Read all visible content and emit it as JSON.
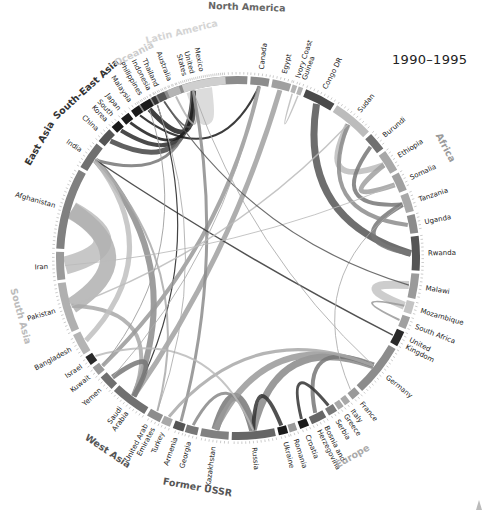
{
  "title": "1990–1995",
  "chart_data": {
    "type": "chord",
    "title": "1990–1995",
    "center": [
      238,
      258
    ],
    "outer_radius": 182,
    "regions": [
      {
        "name": "North America",
        "color": "#555555",
        "countries": [
          "United States",
          "Canada"
        ]
      },
      {
        "name": "Africa",
        "color": "#9a9a9a",
        "countries": [
          "Egypt",
          "Ivory Coast",
          "Guinea",
          "Congo DR",
          "Sudan",
          "Burundi",
          "Ethiopia",
          "Somalia",
          "Tanzania",
          "Uganda",
          "Rwanda",
          "Malawi",
          "Mozambique",
          "South Africa"
        ]
      },
      {
        "name": "Europe",
        "color": "#aaaaaa",
        "countries": [
          "United Kingdom",
          "Germany",
          "France",
          "Italy",
          "Greece",
          "Serbia",
          "Bosnia and Herzegovina",
          "Croatia",
          "Romania",
          "Ukraine"
        ]
      },
      {
        "name": "Former USSR",
        "color": "#555555",
        "countries": [
          "Russia",
          "Kazakhstan",
          "Georgia",
          "Armenia"
        ]
      },
      {
        "name": "West Asia",
        "color": "#555555",
        "countries": [
          "Turkey",
          "United Arab Emirates",
          "Saudi Arabia",
          "Yemen",
          "Kuwait",
          "Israel"
        ]
      },
      {
        "name": "South Asia",
        "color": "#bbbbbb",
        "countries": [
          "Bangladesh",
          "Pakistan",
          "Iran",
          "Afghanistan",
          "India"
        ]
      },
      {
        "name": "East Asia",
        "color": "#333333",
        "countries": [
          "China",
          "South Korea",
          "Japan"
        ]
      },
      {
        "name": "South-East Asia",
        "color": "#333333",
        "countries": [
          "Malaysia",
          "Philippines",
          "Indonesia",
          "Thailand"
        ]
      },
      {
        "name": "Oceania",
        "color": "#cccccc",
        "countries": [
          "Australia"
        ]
      },
      {
        "name": "Latin America",
        "color": "#d4d4d4",
        "countries": [
          "Mexico"
        ]
      }
    ],
    "segments": [
      {
        "label": "United States",
        "lines": [
          "United",
          "States"
        ],
        "start": -33,
        "end": 3,
        "fill": "#8c8c8c"
      },
      {
        "label": "Canada",
        "lines": [
          "Canada"
        ],
        "start": 4,
        "end": 10,
        "fill": "#8c8c8c"
      },
      {
        "label": "Egypt",
        "lines": [
          "Egypt"
        ],
        "start": 11,
        "end": 17,
        "fill": "#a0a0a0"
      },
      {
        "label": "Ivory Coast",
        "lines": [
          "Ivory Coast"
        ],
        "start": 17.5,
        "end": 19,
        "fill": "#b4b4b4"
      },
      {
        "label": "Guinea",
        "lines": [
          "Guinea"
        ],
        "start": 19.5,
        "end": 21,
        "fill": "#b4b4b4"
      },
      {
        "label": "Congo DR",
        "lines": [
          "Congo DR"
        ],
        "start": 22,
        "end": 32,
        "fill": "#4a4a4a"
      },
      {
        "label": "Sudan",
        "lines": [
          "Sudan"
        ],
        "start": 33,
        "end": 46,
        "fill": "#bcbcbc"
      },
      {
        "label": "Burundi",
        "lines": [
          "Burundi"
        ],
        "start": 47,
        "end": 53,
        "fill": "#707070"
      },
      {
        "label": "Ethiopia",
        "lines": [
          "Ethiopia"
        ],
        "start": 54,
        "end": 61,
        "fill": "#a8a8a8"
      },
      {
        "label": "Somalia",
        "lines": [
          "Somalia"
        ],
        "start": 62,
        "end": 68,
        "fill": "#a0a0a0"
      },
      {
        "label": "Tanzania",
        "lines": [
          "Tanzania"
        ],
        "start": 69,
        "end": 75,
        "fill": "#a8a8a8"
      },
      {
        "label": "Uganda",
        "lines": [
          "Uganda"
        ],
        "start": 76,
        "end": 82,
        "fill": "#8c8c8c"
      },
      {
        "label": "Rwanda",
        "lines": [
          "Rwanda"
        ],
        "start": 83,
        "end": 94,
        "fill": "#555555"
      },
      {
        "label": "Malawi",
        "lines": [
          "Malawi"
        ],
        "start": 95,
        "end": 103,
        "fill": "#9a9a9a"
      },
      {
        "label": "Mozambique",
        "lines": [
          "Mozambique"
        ],
        "start": 104,
        "end": 108,
        "fill": "#c4c4c4"
      },
      {
        "label": "South Africa",
        "lines": [
          "South Africa"
        ],
        "start": 109,
        "end": 113,
        "fill": "#a0a0a0"
      },
      {
        "label": "United Kingdom",
        "lines": [
          "United",
          "Kingdom"
        ],
        "start": 114,
        "end": 119,
        "fill": "#2a2a2a"
      },
      {
        "label": "Germany",
        "lines": [
          "Germany"
        ],
        "start": 120,
        "end": 137,
        "fill": "#8c8c8c"
      },
      {
        "label": "France",
        "lines": [
          "France"
        ],
        "start": 138,
        "end": 141,
        "fill": "#9a9a9a"
      },
      {
        "label": "Italy",
        "lines": [
          "Italy"
        ],
        "start": 142,
        "end": 144,
        "fill": "#a8a8a8"
      },
      {
        "label": "Greece",
        "lines": [
          "Greece"
        ],
        "start": 144.5,
        "end": 146.5,
        "fill": "#a8a8a8"
      },
      {
        "label": "Serbia",
        "lines": [
          "Serbia"
        ],
        "start": 147,
        "end": 150,
        "fill": "#7a7a7a"
      },
      {
        "label": "Bosnia and Herzegovina",
        "lines": [
          "Bosnia and",
          "Herzegovina"
        ],
        "start": 151,
        "end": 156,
        "fill": "#666666"
      },
      {
        "label": "Croatia",
        "lines": [
          "Croatia"
        ],
        "start": 157,
        "end": 160,
        "fill": "#1a1a1a"
      },
      {
        "label": "Romania",
        "lines": [
          "Romania"
        ],
        "start": 161,
        "end": 163.5,
        "fill": "#9a9a9a"
      },
      {
        "label": "Ukraine",
        "lines": [
          "Ukraine"
        ],
        "start": 164,
        "end": 167,
        "fill": "#1a1a1a"
      },
      {
        "label": "Russia",
        "lines": [
          "Russia"
        ],
        "start": 168,
        "end": 182,
        "fill": "#666666"
      },
      {
        "label": "Kazakhstan",
        "lines": [
          "Kazakhstan"
        ],
        "start": 183,
        "end": 192,
        "fill": "#808080"
      },
      {
        "label": "Georgia",
        "lines": [
          "Georgia"
        ],
        "start": 193,
        "end": 197,
        "fill": "#777777"
      },
      {
        "label": "Armenia",
        "lines": [
          "Armenia"
        ],
        "start": 197.5,
        "end": 201,
        "fill": "#555555"
      },
      {
        "label": "Turkey",
        "lines": [
          "Turkey"
        ],
        "start": 202,
        "end": 205,
        "fill": "#a8a8a8"
      },
      {
        "label": "United Arab Emirates",
        "lines": [
          "United Arab",
          "Emirates"
        ],
        "start": 205.5,
        "end": 210,
        "fill": "#8c8c8c"
      },
      {
        "label": "Saudi Arabia",
        "lines": [
          "Saudi",
          "Arabia"
        ],
        "start": 211,
        "end": 223,
        "fill": "#707070"
      },
      {
        "label": "Yemen",
        "lines": [
          "Yemen"
        ],
        "start": 224,
        "end": 229,
        "fill": "#707070"
      },
      {
        "label": "Kuwait",
        "lines": [
          "Kuwait"
        ],
        "start": 230,
        "end": 233,
        "fill": "#9a9a9a"
      },
      {
        "label": "Israel",
        "lines": [
          "Israel"
        ],
        "start": 234,
        "end": 237,
        "fill": "#2a2a2a"
      },
      {
        "label": "Bangladesh",
        "lines": [
          "Bangladesh"
        ],
        "start": 238,
        "end": 245,
        "fill": "#b4b4b4"
      },
      {
        "label": "Pakistan",
        "lines": [
          "Pakistan"
        ],
        "start": 246,
        "end": 262,
        "fill": "#b0b0b0"
      },
      {
        "label": "Iran",
        "lines": [
          "Iran"
        ],
        "start": 263,
        "end": 272,
        "fill": "#9a9a9a"
      },
      {
        "label": "Afghanistan",
        "lines": [
          "Afghanistan"
        ],
        "start": 273,
        "end": 299,
        "fill": "#808080"
      },
      {
        "label": "India",
        "lines": [
          "India"
        ],
        "start": 300,
        "end": 309,
        "fill": "#707070"
      },
      {
        "label": "China",
        "lines": [
          "China"
        ],
        "start": 310,
        "end": 315,
        "fill": "#555555"
      },
      {
        "label": "South Korea",
        "lines": [
          "South",
          "Korea"
        ],
        "start": 316,
        "end": 319,
        "fill": "#1a1a1a"
      },
      {
        "label": "Japan",
        "lines": [
          "Japan"
        ],
        "start": 320,
        "end": 323,
        "fill": "#1a1a1a"
      },
      {
        "label": "Malaysia",
        "lines": [
          "Malaysia"
        ],
        "start": 324,
        "end": 327,
        "fill": "#1a1a1a"
      },
      {
        "label": "Philippines",
        "lines": [
          "Philippines"
        ],
        "start": 327.5,
        "end": 331,
        "fill": "#1a1a1a"
      },
      {
        "label": "Indonesia",
        "lines": [
          "Indonesia"
        ],
        "start": 331.5,
        "end": 333,
        "fill": "#333333"
      },
      {
        "label": "Thailand",
        "lines": [
          "Thailand"
        ],
        "start": 333.5,
        "end": 336,
        "fill": "#555555"
      },
      {
        "label": "Australia",
        "lines": [
          "Australia"
        ],
        "start": 337,
        "end": 341,
        "fill": "#b4b4b4"
      },
      {
        "label": "Mexico",
        "lines": [
          "Mexico"
        ],
        "start": 342,
        "end": 356,
        "fill": "#cfcfcf"
      }
    ],
    "region_labels": [
      {
        "name": "North America",
        "angle": 2,
        "r": 248,
        "color": "#666666"
      },
      {
        "name": "Africa",
        "angle": 62,
        "r": 232,
        "color": "#9a9a9a"
      },
      {
        "name": "Europe",
        "angle": 150,
        "r": 232,
        "color": "#aaaaaa"
      },
      {
        "name": "Former USSR",
        "angle": 190,
        "r": 236,
        "color": "#555555"
      },
      {
        "name": "West Asia",
        "angle": 214,
        "r": 236,
        "color": "#555555"
      },
      {
        "name": "South Asia",
        "angle": 255,
        "r": 228,
        "color": "#bbbbbb"
      },
      {
        "name": "East Asia",
        "angle": 300,
        "r": 226,
        "color": "#333333"
      },
      {
        "name": "South-East Asia",
        "angle": 318,
        "r": 224,
        "color": "#333333"
      },
      {
        "name": "Oceania",
        "angle": 333,
        "r": 226,
        "color": "#cccccc"
      },
      {
        "name": "Latin America",
        "angle": 346,
        "r": 230,
        "color": "#d4d4d4"
      }
    ],
    "flows": [
      {
        "from": "Mexico",
        "to": "United States",
        "width": 14,
        "color": "#d6d6d6"
      },
      {
        "from": "Philippines",
        "to": "United States",
        "width": 5,
        "color": "#1f1f1f"
      },
      {
        "from": "South Korea",
        "to": "United States",
        "width": 4,
        "color": "#2a2a2a"
      },
      {
        "from": "China",
        "to": "United States",
        "width": 5,
        "color": "#444444"
      },
      {
        "from": "India",
        "to": "United States",
        "width": 3,
        "color": "#777777"
      },
      {
        "from": "Japan",
        "to": "United States",
        "width": 3,
        "color": "#1a1a1a"
      },
      {
        "from": "Malaysia",
        "to": "Canada",
        "width": 2,
        "color": "#1a1a1a"
      },
      {
        "from": "Indonesia",
        "to": "Saudi Arabia",
        "width": 1.2,
        "color": "#222222"
      },
      {
        "from": "Thailand",
        "to": "United States",
        "width": 2,
        "color": "#555555"
      },
      {
        "from": "Australia",
        "to": "United States",
        "width": 2,
        "color": "#b0b0b0"
      },
      {
        "from": "Afghanistan",
        "to": "Iran",
        "width": 18,
        "color": "#bdbdbd"
      },
      {
        "from": "Afghanistan",
        "to": "Pakistan",
        "width": 16,
        "color": "#b0b0b0"
      },
      {
        "from": "India",
        "to": "Saudi Arabia",
        "width": 6,
        "color": "#8c8c8c"
      },
      {
        "from": "Pakistan",
        "to": "Saudi Arabia",
        "width": 4,
        "color": "#a8a8a8"
      },
      {
        "from": "Bangladesh",
        "to": "India",
        "width": 5,
        "color": "#c0c0c0"
      },
      {
        "from": "Egypt",
        "to": "Saudi Arabia",
        "width": 5,
        "color": "#a0a0a0"
      },
      {
        "from": "Canada",
        "to": "Kuwait",
        "width": 4,
        "color": "#999999"
      },
      {
        "from": "United States",
        "to": "Armenia",
        "width": 3,
        "color": "#8c8c8c"
      },
      {
        "from": "Sudan",
        "to": "Ethiopia",
        "width": 6,
        "color": "#bcbcbc"
      },
      {
        "from": "Somalia",
        "to": "Ethiopia",
        "width": 5,
        "color": "#a0a0a0"
      },
      {
        "from": "Rwanda",
        "to": "Congo DR",
        "width": 7,
        "color": "#555555"
      },
      {
        "from": "Rwanda",
        "to": "Tanzania",
        "width": 5,
        "color": "#777777"
      },
      {
        "from": "Burundi",
        "to": "Tanzania",
        "width": 4,
        "color": "#777777"
      },
      {
        "from": "Uganda",
        "to": "Sudan",
        "width": 4,
        "color": "#8c8c8c"
      },
      {
        "from": "Mozambique",
        "to": "Malawi",
        "width": 8,
        "color": "#c4c4c4"
      },
      {
        "from": "Russia",
        "to": "Kazakhstan",
        "width": 8,
        "color": "#777777"
      },
      {
        "from": "Russia",
        "to": "Germany",
        "width": 7,
        "color": "#888888"
      },
      {
        "from": "Kazakhstan",
        "to": "Germany",
        "width": 6,
        "color": "#999999"
      },
      {
        "from": "Bosnia and Herzegovina",
        "to": "Germany",
        "width": 4,
        "color": "#777777"
      },
      {
        "from": "Croatia",
        "to": "Serbia",
        "width": 3,
        "color": "#333333"
      },
      {
        "from": "Ukraine",
        "to": "Russia",
        "width": 4,
        "color": "#333333"
      },
      {
        "from": "Georgia",
        "to": "Russia",
        "width": 3,
        "color": "#888888"
      },
      {
        "from": "United Kingdom",
        "to": "India",
        "width": 1.5,
        "color": "#333333"
      },
      {
        "from": "Yemen",
        "to": "Saudi Arabia",
        "width": 5,
        "color": "#777777"
      },
      {
        "from": "Turkey",
        "to": "Germany",
        "width": 3,
        "color": "#a8a8a8"
      },
      {
        "from": "South Africa",
        "to": "Mozambique",
        "width": 2,
        "color": "#999999"
      },
      {
        "from": "Israel",
        "to": "Russia",
        "width": 2,
        "color": "#bbbbbb"
      },
      {
        "from": "United Arab Emirates",
        "to": "India",
        "width": 2,
        "color": "#aaaaaa"
      },
      {
        "from": "Ivory Coast",
        "to": "Guinea",
        "width": 1.5,
        "color": "#bbbbbb"
      },
      {
        "from": "Sudan",
        "to": "Pakistan",
        "width": 1.5,
        "color": "#bbbbbb"
      },
      {
        "from": "Somalia",
        "to": "Iran",
        "width": 1,
        "color": "#bbbbbb"
      },
      {
        "from": "Philippines",
        "to": "Kuwait",
        "width": 1,
        "color": "#999999"
      },
      {
        "from": "Indonesia",
        "to": "United Arab Emirates",
        "width": 1,
        "color": "#aaaaaa"
      },
      {
        "from": "France",
        "to": "Tanzania",
        "width": 1,
        "color": "#aaaaaa"
      },
      {
        "from": "Thailand",
        "to": "Malawi",
        "width": 1.2,
        "color": "#555555"
      },
      {
        "from": "Canada",
        "to": "Yemen",
        "width": 1,
        "color": "#aaaaaa"
      },
      {
        "from": "United States",
        "to": "Germany",
        "width": 1,
        "color": "#aaaaaa"
      }
    ]
  }
}
